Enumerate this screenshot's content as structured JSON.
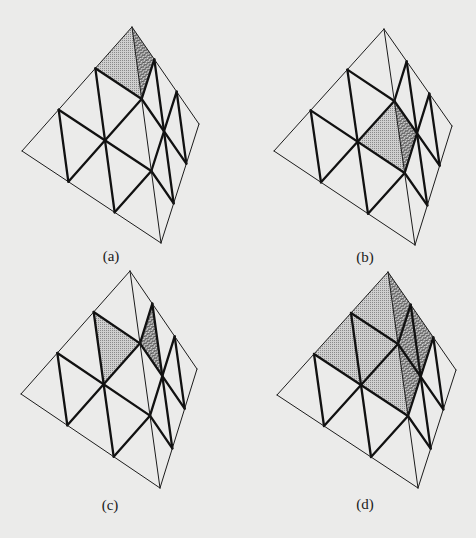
{
  "figure": {
    "colors": {
      "background": "#ebebea",
      "edge": "#1c1c1c",
      "dotted_fill": "#c9c9c9",
      "dotted_dot": "#8a8a8a",
      "hatch_fill": "#d4d4d4",
      "hatch_line": "#2a2a2a"
    },
    "subdivision": 3,
    "panels": [
      {
        "id": "a",
        "label": "(a)",
        "label_pos": [
          111,
          256
        ],
        "vertices": {
          "apex": [
            132,
            27
          ],
          "left": [
            22,
            151
          ],
          "bottom": [
            161,
            243
          ],
          "right": [
            199,
            124
          ]
        },
        "shaded": [
          {
            "face": "left",
            "style": "dotted",
            "tri": [
              [
                3,
                0,
                0
              ],
              [
                2,
                1,
                0
              ],
              [
                2,
                0,
                1
              ]
            ]
          },
          {
            "face": "right",
            "style": "hatched",
            "tri": [
              [
                3,
                0,
                0
              ],
              [
                2,
                1,
                0
              ],
              [
                2,
                0,
                1
              ]
            ]
          }
        ]
      },
      {
        "id": "b",
        "label": "(b)",
        "label_pos": [
          365,
          257
        ],
        "vertices": {
          "apex": [
            384,
            29
          ],
          "left": [
            274,
            151
          ],
          "bottom": [
            415,
            245
          ],
          "right": [
            452,
            126
          ]
        },
        "shaded": [
          {
            "face": "left",
            "style": "dotted",
            "tri": [
              [
                2,
                0,
                1
              ],
              [
                1,
                1,
                1
              ],
              [
                1,
                0,
                2
              ]
            ]
          },
          {
            "face": "right",
            "style": "hatched",
            "tri": [
              [
                2,
                1,
                0
              ],
              [
                1,
                1,
                1
              ],
              [
                1,
                2,
                0
              ]
            ]
          }
        ]
      },
      {
        "id": "c",
        "label": "(c)",
        "label_pos": [
          110,
          505
        ],
        "vertices": {
          "apex": [
            130,
            271
          ],
          "left": [
            21,
            394
          ],
          "bottom": [
            160,
            488
          ],
          "right": [
            197,
            369
          ]
        },
        "shaded": [
          {
            "face": "left",
            "style": "dotted",
            "tri": [
              [
                2,
                1,
                0
              ],
              [
                2,
                0,
                1
              ],
              [
                1,
                1,
                1
              ]
            ]
          },
          {
            "face": "right",
            "style": "hatched",
            "tri": [
              [
                2,
                0,
                1
              ],
              [
                2,
                1,
                0
              ],
              [
                1,
                1,
                1
              ]
            ]
          }
        ]
      },
      {
        "id": "d",
        "label": "(d)",
        "label_pos": [
          365,
          504
        ],
        "vertices": {
          "apex": [
            388,
            272
          ],
          "left": [
            277,
            395
          ],
          "bottom": [
            418,
            488
          ],
          "right": [
            456,
            370
          ]
        },
        "shaded": [
          {
            "face": "left",
            "style": "dotted",
            "tri": [
              [
                3,
                0,
                0
              ],
              [
                1,
                2,
                0
              ],
              [
                1,
                0,
                2
              ]
            ]
          },
          {
            "face": "right",
            "style": "hatched",
            "tri": [
              [
                3,
                0,
                0
              ],
              [
                1,
                2,
                0
              ],
              [
                1,
                0,
                2
              ]
            ]
          }
        ]
      }
    ]
  }
}
